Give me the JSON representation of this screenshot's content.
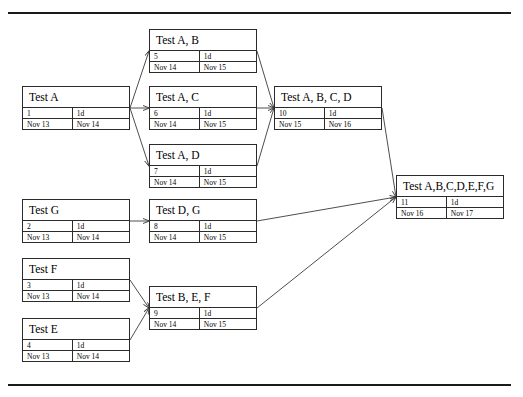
{
  "diagram": {
    "type": "network-diagram",
    "canvas": {
      "width": 523,
      "height": 397
    },
    "frame": {
      "top_rule": true,
      "bottom_rule": true,
      "color": "#1a1a1a"
    },
    "edge_color": "#3a3a3a",
    "node_border_color": "#2b2b2b",
    "node_fill": "#ffffff",
    "duration_label": "1d",
    "nodes": [
      {
        "key": "test-a",
        "name": "Test A",
        "id": "1",
        "duration": "1d",
        "start": "Nov 13",
        "finish": "Nov 14",
        "x": 22,
        "y": 86,
        "w": 108,
        "h": 44
      },
      {
        "key": "test-g",
        "name": "Test G",
        "id": "2",
        "duration": "1d",
        "start": "Nov 13",
        "finish": "Nov 14",
        "x": 22,
        "y": 199,
        "w": 108,
        "h": 44
      },
      {
        "key": "test-f",
        "name": "Test F",
        "id": "3",
        "duration": "1d",
        "start": "Nov 13",
        "finish": "Nov 14",
        "x": 22,
        "y": 258,
        "w": 108,
        "h": 44
      },
      {
        "key": "test-e",
        "name": "Test E",
        "id": "4",
        "duration": "1d",
        "start": "Nov 13",
        "finish": "Nov 14",
        "x": 22,
        "y": 318,
        "w": 108,
        "h": 44
      },
      {
        "key": "test-ab",
        "name": "Test A, B",
        "id": "5",
        "duration": "1d",
        "start": "Nov 14",
        "finish": "Nov 15",
        "x": 149,
        "y": 29,
        "w": 108,
        "h": 44
      },
      {
        "key": "test-ac",
        "name": "Test A, C",
        "id": "6",
        "duration": "1d",
        "start": "Nov 14",
        "finish": "Nov 15",
        "x": 149,
        "y": 86,
        "w": 108,
        "h": 44
      },
      {
        "key": "test-ad",
        "name": "Test A, D",
        "id": "7",
        "duration": "1d",
        "start": "Nov 14",
        "finish": "Nov 15",
        "x": 149,
        "y": 144,
        "w": 108,
        "h": 44
      },
      {
        "key": "test-dg",
        "name": "Test D, G",
        "id": "8",
        "duration": "1d",
        "start": "Nov 14",
        "finish": "Nov 15",
        "x": 149,
        "y": 199,
        "w": 108,
        "h": 44
      },
      {
        "key": "test-bef",
        "name": "Test B, E, F",
        "id": "9",
        "duration": "1d",
        "start": "Nov 14",
        "finish": "Nov 15",
        "x": 149,
        "y": 286,
        "w": 108,
        "h": 44
      },
      {
        "key": "test-abcd",
        "name": "Test A, B, C, D",
        "id": "10",
        "duration": "1d",
        "start": "Nov 15",
        "finish": "Nov 16",
        "x": 274,
        "y": 86,
        "w": 108,
        "h": 44
      },
      {
        "key": "test-abcdefg",
        "name": "Test A,B,C,D,E,F,G",
        "id": "11",
        "duration": "1d",
        "start": "Nov 16",
        "finish": "Nov 17",
        "x": 396,
        "y": 175,
        "w": 108,
        "h": 44
      }
    ],
    "edges": [
      {
        "from": "test-a",
        "to": "test-ab",
        "path": "M130,108 L149,51"
      },
      {
        "from": "test-a",
        "to": "test-ac",
        "path": "M130,108 L149,108"
      },
      {
        "from": "test-a",
        "to": "test-ad",
        "path": "M130,108 L149,166"
      },
      {
        "from": "test-ab",
        "to": "test-abcd",
        "path": "M257,51 L274,108"
      },
      {
        "from": "test-ac",
        "to": "test-abcd",
        "path": "M257,108 L274,108"
      },
      {
        "from": "test-ad",
        "to": "test-abcd",
        "path": "M257,166 L274,108"
      },
      {
        "from": "test-abcd",
        "to": "test-abcdefg",
        "path": "M382,108 L396,197"
      },
      {
        "from": "test-g",
        "to": "test-dg",
        "path": "M130,221 L149,221"
      },
      {
        "from": "test-dg",
        "to": "test-abcdefg",
        "path": "M257,221 L396,197"
      },
      {
        "from": "test-f",
        "to": "test-bef",
        "path": "M130,280 L149,308"
      },
      {
        "from": "test-e",
        "to": "test-bef",
        "path": "M130,340 L149,308"
      },
      {
        "from": "test-bef",
        "to": "test-abcdefg",
        "path": "M257,308 L396,197"
      }
    ]
  }
}
